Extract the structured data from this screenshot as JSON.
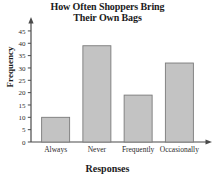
{
  "chart_data": {
    "type": "bar",
    "title": "How Often Shoppers Bring Their Own Bags",
    "title_line1": "How Often Shoppers Bring",
    "title_line2": "Their Own Bags",
    "xlabel": "Responses",
    "ylabel": "Frequency",
    "categories": [
      "Always",
      "Never",
      "Frequently",
      "Occasionally"
    ],
    "values": [
      10,
      39,
      19,
      32
    ],
    "ylim": [
      0,
      47
    ],
    "yticks": [
      0,
      5,
      10,
      15,
      20,
      25,
      30,
      35,
      40,
      45
    ],
    "ytick_labels": [
      "0",
      "5",
      "10",
      "15",
      "20",
      "25",
      "30",
      "35",
      "40",
      "45"
    ],
    "grid": false,
    "legend": null,
    "bar_fill_color": "#c3c3c3",
    "bar_edge_color": "#7a7a7a",
    "axis_color": "#4a4a4a",
    "axis_arrows": true
  }
}
